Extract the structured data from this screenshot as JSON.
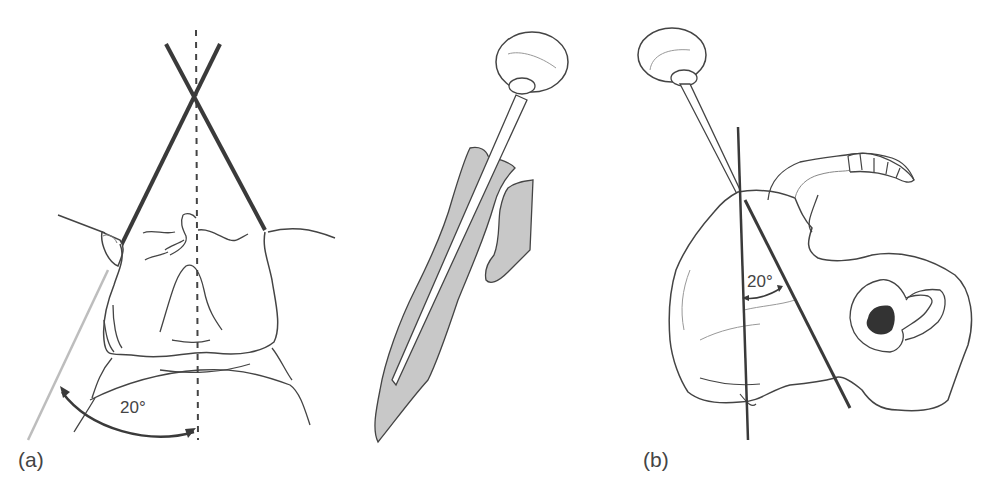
{
  "figure": {
    "panels": [
      {
        "id": "a",
        "label": "(a)",
        "angle_label": "20°",
        "description": "Frontal view of pelvis with two crossing guide wires and a vertical dashed midline; curved double arrow showing 20° angle"
      },
      {
        "id": "middle",
        "label": "",
        "description": "Awl / trocar inserted along shaded bone channel"
      },
      {
        "id": "b",
        "label": "(b)",
        "angle_label": "20°",
        "description": "Lateral view of hemipelvis with vertical reference line and instrument line inclined 20°"
      }
    ],
    "colors": {
      "line": "#3a3a3a",
      "thin_line": "#555555",
      "shade": "#c8c8c8",
      "dark_fill": "#333333",
      "light_line": "#bdbdbd"
    }
  }
}
